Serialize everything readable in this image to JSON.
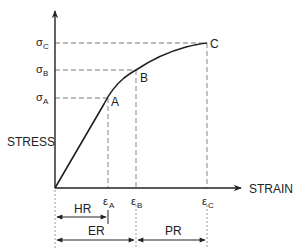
{
  "diagram": {
    "axes": {
      "y_label": "STRESS",
      "x_label": "STRAIN"
    },
    "points": [
      {
        "id": "A",
        "label": "A",
        "x": 108,
        "y": 98
      },
      {
        "id": "B",
        "label": "B",
        "x": 136,
        "y": 70
      },
      {
        "id": "C",
        "label": "C",
        "x": 207,
        "y": 43
      }
    ],
    "stress_levels": [
      {
        "symbol": "σ",
        "sub": "A"
      },
      {
        "symbol": "σ",
        "sub": "B"
      },
      {
        "symbol": "σ",
        "sub": "C"
      }
    ],
    "strain_levels": [
      {
        "symbol": "ε",
        "sub": "A"
      },
      {
        "symbol": "ε",
        "sub": "B"
      },
      {
        "symbol": "ε",
        "sub": "C"
      }
    ],
    "ranges": [
      {
        "label": "HR",
        "from": "0",
        "to": "εA"
      },
      {
        "label": "ER",
        "from": "0",
        "to": "εB"
      },
      {
        "label": "PR",
        "from": "εB",
        "to": "εC"
      }
    ],
    "colors": {
      "curve": "#222222",
      "axis": "#222222",
      "guide": "#777777",
      "dimension": "#222222"
    }
  }
}
